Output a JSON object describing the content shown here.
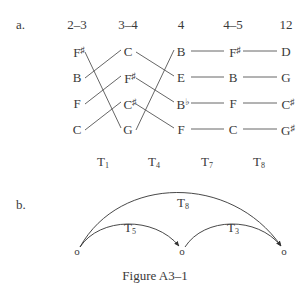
{
  "part_a": {
    "label": "a.",
    "columns": [
      {
        "header": "2–3",
        "x": 77,
        "notes": [
          {
            "letter": "F",
            "acc": "♯"
          },
          {
            "letter": "B",
            "acc": ""
          },
          {
            "letter": "F",
            "acc": ""
          },
          {
            "letter": "C",
            "acc": ""
          }
        ]
      },
      {
        "header": "3–4",
        "x": 128,
        "notes": [
          {
            "letter": "C",
            "acc": ""
          },
          {
            "letter": "F",
            "acc": "♯"
          },
          {
            "letter": "C",
            "acc": "♯"
          },
          {
            "letter": "G",
            "acc": ""
          }
        ]
      },
      {
        "header": "4",
        "x": 181,
        "notes": [
          {
            "letter": "B",
            "acc": ""
          },
          {
            "letter": "E",
            "acc": ""
          },
          {
            "letter": "B",
            "acc": "♭"
          },
          {
            "letter": "F",
            "acc": ""
          }
        ]
      },
      {
        "header": "4–5",
        "x": 233,
        "notes": [
          {
            "letter": "F",
            "acc": "♯"
          },
          {
            "letter": "B",
            "acc": ""
          },
          {
            "letter": "F",
            "acc": ""
          },
          {
            "letter": "C",
            "acc": ""
          }
        ]
      },
      {
        "header": "12",
        "x": 286,
        "notes": [
          {
            "letter": "D",
            "acc": ""
          },
          {
            "letter": "G",
            "acc": ""
          },
          {
            "letter": "C",
            "acc": "♯"
          },
          {
            "letter": "G",
            "acc": "♯"
          }
        ]
      }
    ],
    "row_y": [
      51,
      77,
      103,
      129
    ],
    "connections_1_to_2": [
      [
        0,
        3
      ],
      [
        1,
        0
      ],
      [
        2,
        1
      ],
      [
        3,
        2
      ]
    ],
    "connections_2_to_3": [
      [
        0,
        1
      ],
      [
        1,
        2
      ],
      [
        2,
        3
      ],
      [
        3,
        0
      ]
    ],
    "transpositions": [
      {
        "base": "T",
        "sub": "1",
        "x": 103
      },
      {
        "base": "T",
        "sub": "4",
        "x": 154
      },
      {
        "base": "T",
        "sub": "7",
        "x": 207
      },
      {
        "base": "T",
        "sub": "8",
        "x": 259
      }
    ]
  },
  "part_b": {
    "label": "b.",
    "nodes": [
      {
        "symbol": "o",
        "x": 77,
        "y": 251
      },
      {
        "symbol": "o",
        "x": 182,
        "y": 251
      },
      {
        "symbol": "o",
        "x": 284,
        "y": 251
      }
    ],
    "arrows": [
      {
        "base": "T",
        "sub": "5",
        "from": 0,
        "to": 1,
        "label_x": 130,
        "label_y": 229
      },
      {
        "base": "T",
        "sub": "3",
        "from": 1,
        "to": 2,
        "label_x": 233,
        "label_y": 229
      },
      {
        "base": "T",
        "sub": "8",
        "from": 0,
        "to": 2,
        "label_x": 183,
        "label_y": 204
      }
    ]
  },
  "caption": "Figure A3–1"
}
